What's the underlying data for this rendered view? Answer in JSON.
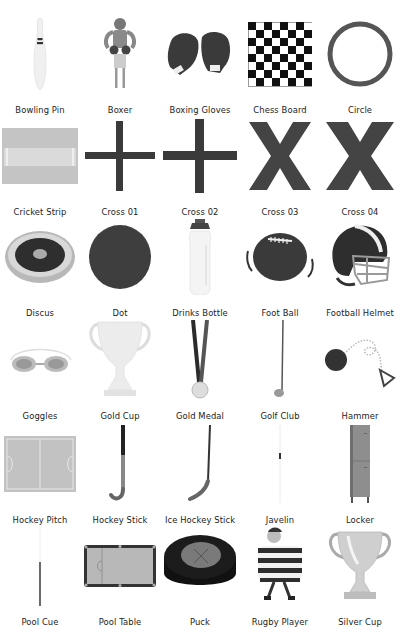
{
  "gallery": {
    "items": [
      {
        "label": "Bowling Pin",
        "icon": "bowling-pin-icon"
      },
      {
        "label": "Boxer",
        "icon": "boxer-icon"
      },
      {
        "label": "Boxing Gloves",
        "icon": "boxing-gloves-icon"
      },
      {
        "label": "Chess Board",
        "icon": "chess-board-icon"
      },
      {
        "label": "Circle",
        "icon": "circle-icon"
      },
      {
        "label": "Cricket Strip",
        "icon": "cricket-strip-icon"
      },
      {
        "label": "Cross 01",
        "icon": "cross-01-icon"
      },
      {
        "label": "Cross 02",
        "icon": "cross-02-icon"
      },
      {
        "label": "Cross 03",
        "icon": "cross-03-icon"
      },
      {
        "label": "Cross 04",
        "icon": "cross-04-icon"
      },
      {
        "label": "Discus",
        "icon": "discus-icon"
      },
      {
        "label": "Dot",
        "icon": "dot-icon"
      },
      {
        "label": "Drinks Bottle",
        "icon": "drinks-bottle-icon"
      },
      {
        "label": "Foot Ball",
        "icon": "football-icon"
      },
      {
        "label": "Football Helmet",
        "icon": "football-helmet-icon"
      },
      {
        "label": "Goggles",
        "icon": "goggles-icon"
      },
      {
        "label": "Gold Cup",
        "icon": "gold-cup-icon"
      },
      {
        "label": "Gold Medal",
        "icon": "gold-medal-icon"
      },
      {
        "label": "Golf Club",
        "icon": "golf-club-icon"
      },
      {
        "label": "Hammer",
        "icon": "hammer-icon"
      },
      {
        "label": "Hockey Pitch",
        "icon": "hockey-pitch-icon"
      },
      {
        "label": "Hockey Stick",
        "icon": "hockey-stick-icon"
      },
      {
        "label": "Ice Hockey Stick",
        "icon": "ice-hockey-stick-icon"
      },
      {
        "label": "Javelin",
        "icon": "javelin-icon"
      },
      {
        "label": "Locker",
        "icon": "locker-icon"
      },
      {
        "label": "Pool Cue",
        "icon": "pool-cue-icon"
      },
      {
        "label": "Pool Table",
        "icon": "pool-table-icon"
      },
      {
        "label": "Puck",
        "icon": "puck-icon"
      },
      {
        "label": "Rugby Player",
        "icon": "rugby-player-icon"
      },
      {
        "label": "Silver Cup",
        "icon": "silver-cup-icon"
      }
    ]
  }
}
